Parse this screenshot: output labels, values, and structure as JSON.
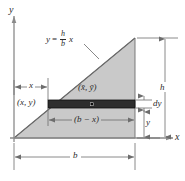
{
  "figure": {
    "axes": {
      "y_axis_label": "y",
      "x_axis_label": "x"
    },
    "curve_equation": {
      "lhs": "y",
      "equals": "=",
      "numerator": "h",
      "denominator": "b",
      "variable": "x",
      "full": "y = (h/b)x"
    },
    "labels": {
      "point_xy": "(x, y)",
      "centroid": "(x̄, ȳ)",
      "strip_width": "(b − x)",
      "dim_x": "x",
      "dim_b": "b",
      "dim_h": "h",
      "dim_dy": "dy",
      "dim_y": "y"
    },
    "colors": {
      "triangle_fill": "#c9c9c9",
      "triangle_stroke": "#6e6e6e",
      "strip_fill": "#2e2e2e",
      "strip_stroke": "#111111",
      "axis": "#8a8a8a",
      "dimension_line": "#6d6d6d",
      "text": "#2b2b2b",
      "background": "#ffffff"
    },
    "geometry": {
      "origin": [
        14,
        138
      ],
      "apex": [
        135,
        38
      ],
      "base_right": [
        135,
        138
      ],
      "strip_top_y": 100,
      "strip_bottom_y": 108,
      "strip_left_x": 48,
      "strip_right_x": 135,
      "centroid_dot": [
        92,
        104
      ]
    }
  }
}
